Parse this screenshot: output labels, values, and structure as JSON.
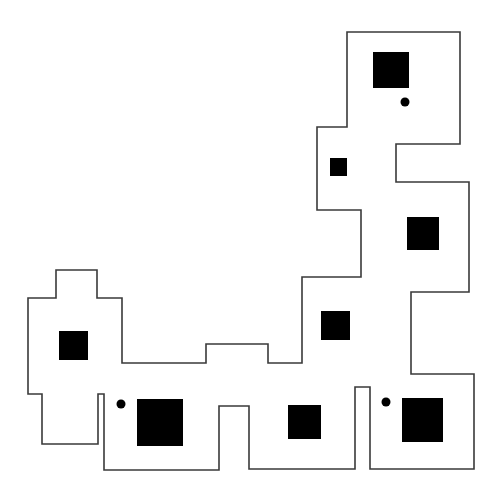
{
  "map": {
    "width": 497,
    "height": 496,
    "background": "#ffffff",
    "outline_color": "#3a3a3a",
    "fill_color": "#000000",
    "boundary": {
      "points": [
        [
          347,
          32
        ],
        [
          460,
          32
        ],
        [
          460,
          144
        ],
        [
          396,
          144
        ],
        [
          396,
          182
        ],
        [
          469,
          182
        ],
        [
          469,
          292
        ],
        [
          411,
          292
        ],
        [
          411,
          374
        ],
        [
          474,
          374
        ],
        [
          474,
          469
        ],
        [
          370,
          469
        ],
        [
          370,
          387
        ],
        [
          355,
          387
        ],
        [
          355,
          469
        ],
        [
          249,
          469
        ],
        [
          249,
          406
        ],
        [
          219,
          406
        ],
        [
          219,
          470
        ],
        [
          104,
          470
        ],
        [
          104,
          394
        ],
        [
          98,
          394
        ],
        [
          98,
          444
        ],
        [
          42,
          444
        ],
        [
          42,
          394
        ],
        [
          28,
          394
        ],
        [
          28,
          298
        ],
        [
          56,
          298
        ],
        [
          56,
          270
        ],
        [
          97,
          270
        ],
        [
          97,
          298
        ],
        [
          122,
          298
        ],
        [
          122,
          363
        ],
        [
          206,
          363
        ],
        [
          206,
          344
        ],
        [
          268,
          344
        ],
        [
          268,
          363
        ],
        [
          302,
          363
        ],
        [
          302,
          277
        ],
        [
          361,
          277
        ],
        [
          361,
          210
        ],
        [
          317,
          210
        ],
        [
          317,
          127
        ],
        [
          347,
          127
        ]
      ]
    },
    "obstacles": [
      {
        "x": 373,
        "y": 52,
        "w": 36,
        "h": 36
      },
      {
        "x": 330,
        "y": 158,
        "w": 17,
        "h": 18
      },
      {
        "x": 407,
        "y": 217,
        "w": 32,
        "h": 33
      },
      {
        "x": 321,
        "y": 311,
        "w": 29,
        "h": 29
      },
      {
        "x": 59,
        "y": 331,
        "w": 29,
        "h": 29
      },
      {
        "x": 137,
        "y": 399,
        "w": 46,
        "h": 47
      },
      {
        "x": 288,
        "y": 405,
        "w": 33,
        "h": 34
      },
      {
        "x": 402,
        "y": 398,
        "w": 41,
        "h": 44
      }
    ],
    "markers": [
      {
        "cx": 405,
        "cy": 102,
        "r": 4.5
      },
      {
        "cx": 121,
        "cy": 404,
        "r": 4.5
      },
      {
        "cx": 386,
        "cy": 402,
        "r": 4.5
      }
    ]
  }
}
